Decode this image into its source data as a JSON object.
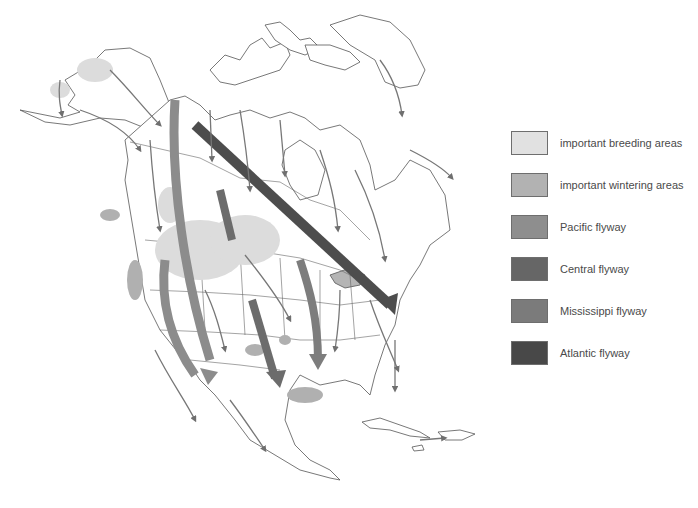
{
  "map": {
    "subject": "North American bird migration flyways",
    "colors": {
      "land": "#ffffff",
      "outline": "#555555",
      "breeding": "#d6d6d6",
      "wintering": "#a9a9a9",
      "pacific": "#8c8c8c",
      "central": "#6c6c6c",
      "mississippi": "#7d7d7d",
      "atlantic": "#4d4d4d",
      "minor_arrow": "#777777"
    }
  },
  "legend": {
    "items": [
      {
        "key": "breeding",
        "label": "important breeding areas",
        "color": "#e1e1e1"
      },
      {
        "key": "wintering",
        "label": "important wintering areas",
        "color": "#b2b2b2"
      },
      {
        "key": "pacific",
        "label": "Pacific flyway",
        "color": "#8e8e8e"
      },
      {
        "key": "central",
        "label": "Central flyway",
        "color": "#666666"
      },
      {
        "key": "mississippi",
        "label": "Mississippi flyway",
        "color": "#7b7b7b"
      },
      {
        "key": "atlantic",
        "label": "Atlantic flyway",
        "color": "#484848"
      }
    ]
  }
}
